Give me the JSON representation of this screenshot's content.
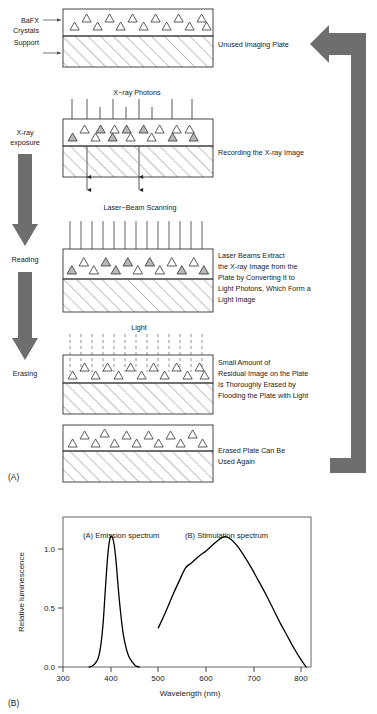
{
  "figure": {
    "part_a_label": "(A)",
    "part_b_label": "(B)",
    "left_labels": {
      "crystals": "BaFX\nCrystals",
      "crystals_line1": "BaFX",
      "crystals_line2": "Crystals",
      "support": "Support"
    },
    "stage_arrows": [
      {
        "name": "x-ray-exposure",
        "label_line1": "X-ray",
        "label_line2": "exposure"
      },
      {
        "name": "reading",
        "label": "Reading"
      },
      {
        "name": "erasing",
        "label": "Erasing"
      }
    ],
    "recycle_arrow_name": "reuse-cycle-arrow",
    "panels": [
      {
        "id": "unused-plate",
        "top_label": "",
        "caption_lines": [
          "Unused Imaging Plate"
        ]
      },
      {
        "id": "recording",
        "top_label": "X−ray Photons",
        "caption_lines": [
          "Recording the X-ray Image"
        ]
      },
      {
        "id": "reading",
        "top_label": "Laser−Beam Scanning",
        "caption_lines": [
          "Laser Beams Extract",
          "the X-ray Image from the",
          "Plate by Converting It to",
          "Light Photons, Which Form a",
          "Light Image"
        ]
      },
      {
        "id": "erasing",
        "top_label": "Light",
        "caption_lines": [
          "Small Amount of",
          "Residual Image on the Plate",
          "Is Thoroughly Erased by",
          "Flooding the Plate with Light"
        ]
      },
      {
        "id": "erased-plate",
        "top_label": "",
        "caption_lines": [
          "Erased Plate Can Be",
          "Used Again"
        ]
      }
    ],
    "colors": {
      "arrow_gray": "#6e6e6e",
      "crystal_fill_excited": "#b8b8b8",
      "crystal_fill_empty": "#ffffff",
      "outline": "#333333",
      "hatch": "#777777"
    }
  },
  "chart_data": {
    "type": "line",
    "title": "",
    "xlabel": "Wavelength (nm)",
    "ylabel": "Relative luminescence",
    "xlim": [
      300,
      820
    ],
    "ylim": [
      0.0,
      1.15
    ],
    "xticks": [
      300,
      400,
      500,
      600,
      700,
      800
    ],
    "yticks": [
      0.0,
      0.5,
      1.0
    ],
    "ytick_labels": [
      "0.0",
      "0.5",
      "1.0"
    ],
    "xtick_labels": [
      "300",
      "400",
      "500",
      "600",
      "700",
      "800"
    ],
    "grid": false,
    "legend": "inline-annotations",
    "annotations": [
      {
        "text": "(A) Emission spectrum",
        "x": 350,
        "y": 1.08
      },
      {
        "text": "(B) Stimulation spectrum",
        "x": 530,
        "y": 1.08
      }
    ],
    "series": [
      {
        "name": "(A) Emission spectrum",
        "x": [
          355,
          362,
          368,
          374,
          379,
          384,
          388,
          392,
          396,
          400,
          404,
          408,
          412,
          416,
          421,
          426,
          432,
          438,
          445,
          452,
          460
        ],
        "values": [
          0.0,
          0.01,
          0.03,
          0.07,
          0.16,
          0.33,
          0.55,
          0.77,
          0.93,
          1.0,
          0.99,
          0.92,
          0.78,
          0.6,
          0.41,
          0.26,
          0.15,
          0.08,
          0.04,
          0.01,
          0.0
        ]
      },
      {
        "name": "(B) Stimulation spectrum",
        "x": [
          500,
          515,
          530,
          545,
          557,
          570,
          585,
          600,
          615,
          628,
          640,
          652,
          665,
          680,
          695,
          710,
          725,
          740,
          755,
          770,
          785,
          800,
          810
        ],
        "values": [
          0.3,
          0.42,
          0.55,
          0.67,
          0.76,
          0.8,
          0.85,
          0.89,
          0.94,
          0.98,
          1.0,
          0.98,
          0.93,
          0.85,
          0.76,
          0.66,
          0.56,
          0.45,
          0.34,
          0.24,
          0.14,
          0.05,
          0.0
        ]
      }
    ]
  }
}
